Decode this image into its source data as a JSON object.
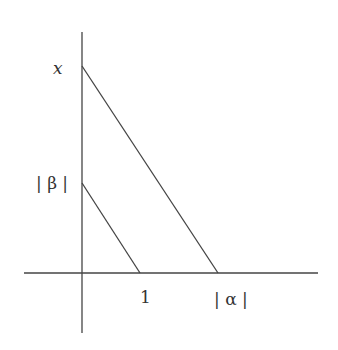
{
  "diagram": {
    "labels": {
      "x": "x",
      "beta": "| β |",
      "one": "1",
      "alpha": "| α |"
    },
    "colors": {
      "stroke": "#444444",
      "text": "#333333",
      "background": "#ffffff"
    }
  }
}
